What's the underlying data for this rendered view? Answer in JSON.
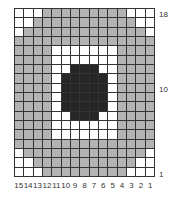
{
  "chart": {
    "title": "",
    "columns": 15,
    "rows": 18,
    "colors": {
      "G": "#b3b3b3",
      "W": "#ffffff",
      "D": "#262626"
    },
    "row_labels": [
      {
        "label": "18",
        "row": 18
      },
      {
        "label": "10",
        "row": 10
      },
      {
        "label": "1",
        "row": 1
      }
    ],
    "column_labels": [
      "15",
      "14",
      "13",
      "12",
      "11",
      "10",
      "9",
      "8",
      "7",
      "6",
      "5",
      "4",
      "3",
      "2",
      "1"
    ],
    "pattern_top_to_bottom": [
      "WWWGGGGGGGGGWWW",
      "WWGGGGGGGGGGGWW",
      "WGGGGGGGGGGGGGW",
      "GGGGGGGGGGGGGGG",
      "GGGGWWWWWWWGGGG",
      "GGGGWWWWWWWGGGG",
      "GGGGWWDDDWWGGGG",
      "GGGGWDDDDDWGGGG",
      "GGGGWDDDDDWGGGG",
      "GGGGWDDDDDWGGGG",
      "GGGGWDDDDDWGGGG",
      "GGGGWWDDDWWGGGG",
      "GGGGWWWWWWWGGGG",
      "GGGGWWWWWWWGGGG",
      "GGGGGGGGGGGGGGG",
      "WGGGGGGGGGGGGGW",
      "WWGGGGGGGGGGGWW",
      "WWWGGGGGGGGGWWW"
    ]
  }
}
